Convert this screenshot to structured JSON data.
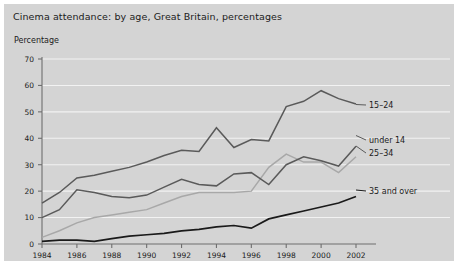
{
  "chart_title": "Cinema attendance: by age, Great Britain, percentages",
  "y_axis_title": "Percentage",
  "colors": {
    "panel_background": "#d4d4d4",
    "gridline": "#f2f2f2",
    "axis": "#6e6e6e",
    "series_15_24": "#5a5a5a",
    "series_under_14": "#a8a8a8",
    "series_25_34": "#5a5a5a",
    "series_35_over": "#1a1a1a",
    "text": "#1b1b1b"
  },
  "labels": {
    "series_15_24": "15–24",
    "series_under_14": "under 14",
    "series_25_34": "25–34",
    "series_35_over": "35 and over"
  },
  "chart_data": {
    "type": "line",
    "title": "Cinema attendance: by age, Great Britain, percentages",
    "xlabel": "",
    "ylabel": "Percentage",
    "ylim": [
      0,
      70
    ],
    "xlim": [
      1984,
      2002
    ],
    "grid": true,
    "legend_position": "right-inline-labels",
    "y_ticks": [
      0,
      10,
      20,
      30,
      40,
      50,
      60,
      70
    ],
    "x_ticks": [
      1984,
      1986,
      1988,
      1990,
      1992,
      1994,
      1996,
      1998,
      2000,
      2002
    ],
    "x": [
      1984,
      1985,
      1986,
      1987,
      1988,
      1989,
      1990,
      1991,
      1992,
      1993,
      1994,
      1995,
      1996,
      1997,
      1998,
      1999,
      2000,
      2001,
      2002
    ],
    "series": [
      {
        "name": "15–24",
        "color": "#5a5a5a",
        "values": [
          15.5,
          19.5,
          25.0,
          26.0,
          27.5,
          29.0,
          31.0,
          33.5,
          35.5,
          35.0,
          44.0,
          36.5,
          39.5,
          39.0,
          52.0,
          54.0,
          58.0,
          55.0,
          53.0
        ]
      },
      {
        "name": "under 14",
        "color": "#a8a8a8",
        "values": [
          2.5,
          5.0,
          8.0,
          10.0,
          11.0,
          12.0,
          13.0,
          15.5,
          18.0,
          19.5,
          19.5,
          19.5,
          20.0,
          29.0,
          34.0,
          31.0,
          31.0,
          27.0,
          33.0
        ]
      },
      {
        "name": "25–34",
        "color": "#5a5a5a",
        "values": [
          10.0,
          13.0,
          20.5,
          19.5,
          18.0,
          17.5,
          18.5,
          21.5,
          24.5,
          22.5,
          22.0,
          26.5,
          27.0,
          22.5,
          30.0,
          33.0,
          31.5,
          29.5,
          37.0
        ]
      },
      {
        "name": "35 and over",
        "color": "#1a1a1a",
        "values": [
          1.0,
          1.5,
          1.5,
          1.0,
          2.0,
          3.0,
          3.5,
          4.0,
          5.0,
          5.5,
          6.5,
          7.0,
          6.0,
          9.5,
          11.0,
          12.5,
          14.0,
          15.5,
          18.0
        ]
      }
    ]
  }
}
